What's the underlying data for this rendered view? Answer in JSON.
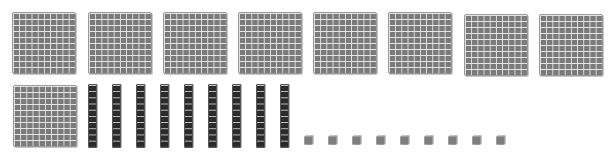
{
  "scene": {
    "description": "Base-ten blocks representing a number",
    "colors": {
      "flat": "#7a7a7a",
      "rod": "#2b2b2b",
      "cube": "#7e7e7e",
      "grid_line": "#ebebeb",
      "background": "#ffffff"
    }
  },
  "blocks": {
    "hundreds": {
      "count": 9,
      "positions": [
        [
          12,
          12
        ],
        [
          88,
          12
        ],
        [
          163,
          12
        ],
        [
          238,
          12
        ],
        [
          313,
          12
        ],
        [
          388,
          12
        ],
        [
          464,
          14
        ],
        [
          539,
          14
        ],
        [
          13,
          85
        ]
      ]
    },
    "tens": {
      "count": 9,
      "positions": [
        [
          88,
          84
        ],
        [
          112,
          84
        ],
        [
          136,
          84
        ],
        [
          160,
          84
        ],
        [
          184,
          84
        ],
        [
          208,
          84
        ],
        [
          232,
          84
        ],
        [
          256,
          84
        ],
        [
          280,
          84
        ]
      ]
    },
    "ones": {
      "count": 9,
      "positions": [
        [
          304,
          136
        ],
        [
          328,
          136
        ],
        [
          352,
          136
        ],
        [
          376,
          136
        ],
        [
          400,
          136
        ],
        [
          424,
          136
        ],
        [
          448,
          136
        ],
        [
          472,
          136
        ],
        [
          496,
          136
        ]
      ]
    }
  }
}
